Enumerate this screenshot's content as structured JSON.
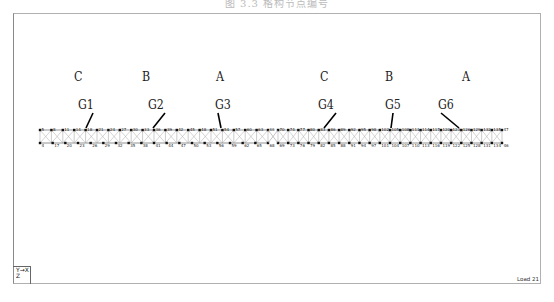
{
  "caption": "图 3.3  格构节点编号",
  "zone_labels": [
    {
      "text": "C",
      "x": 74,
      "y": 69
    },
    {
      "text": "B",
      "x": 142,
      "y": 69
    },
    {
      "text": "A",
      "x": 216,
      "y": 69
    },
    {
      "text": "C",
      "x": 320,
      "y": 69
    },
    {
      "text": "B",
      "x": 385,
      "y": 69
    },
    {
      "text": "A",
      "x": 462,
      "y": 69
    }
  ],
  "girder_labels": [
    {
      "text": "G1",
      "x": 78,
      "y": 97
    },
    {
      "text": "G2",
      "x": 148,
      "y": 97
    },
    {
      "text": "G3",
      "x": 215,
      "y": 97
    },
    {
      "text": "G4",
      "x": 318,
      "y": 97
    },
    {
      "text": "G5",
      "x": 385,
      "y": 97
    },
    {
      "text": "G6",
      "x": 438,
      "y": 97
    }
  ],
  "leaders": [
    {
      "x1": 93,
      "y1": 113,
      "x2": 86,
      "y2": 128
    },
    {
      "x1": 165,
      "y1": 113,
      "x2": 153,
      "y2": 128
    },
    {
      "x1": 218,
      "y1": 113,
      "x2": 221,
      "y2": 128
    },
    {
      "x1": 336,
      "y1": 113,
      "x2": 324,
      "y2": 128
    },
    {
      "x1": 393,
      "y1": 113,
      "x2": 391,
      "y2": 128
    },
    {
      "x1": 441,
      "y1": 113,
      "x2": 459,
      "y2": 128
    }
  ],
  "truss": {
    "top_y": 130,
    "bottom_y": 143,
    "left_segment": {
      "x_start": 40,
      "x_end": 268
    },
    "right_segment": {
      "x_start": 278,
      "x_end": 502
    },
    "top_nodes_left": [
      "5",
      "8",
      "11",
      "14",
      "18",
      "21",
      "24",
      "27",
      "30",
      "33",
      "36",
      "39",
      "42",
      "45",
      "48",
      "51",
      "54",
      "57",
      "60",
      "63",
      "66"
    ],
    "bottom_nodes_left": [
      "4",
      "17",
      "20",
      "23",
      "26",
      "29",
      "32",
      "35",
      "38",
      "41",
      "44",
      "47",
      "50",
      "53",
      "56",
      "59",
      "62",
      "65",
      "68"
    ],
    "top_nodes_right": [
      "70",
      "74",
      "77",
      "80",
      "83",
      "86",
      "89",
      "92",
      "95",
      "98",
      "102",
      "105",
      "108",
      "111",
      "114",
      "117",
      "120",
      "123",
      "126",
      "129",
      "132",
      "135",
      "47"
    ],
    "bottom_nodes_right": [
      "69",
      "73",
      "76",
      "79",
      "82",
      "85",
      "88",
      "91",
      "94",
      "97",
      "101",
      "104",
      "107",
      "110",
      "113",
      "116",
      "119",
      "122",
      "125",
      "128",
      "131",
      "134",
      "46"
    ]
  },
  "axis_indicator": {
    "line1": "Y→X",
    "line2": "Z"
  },
  "load_label": "Load 21"
}
